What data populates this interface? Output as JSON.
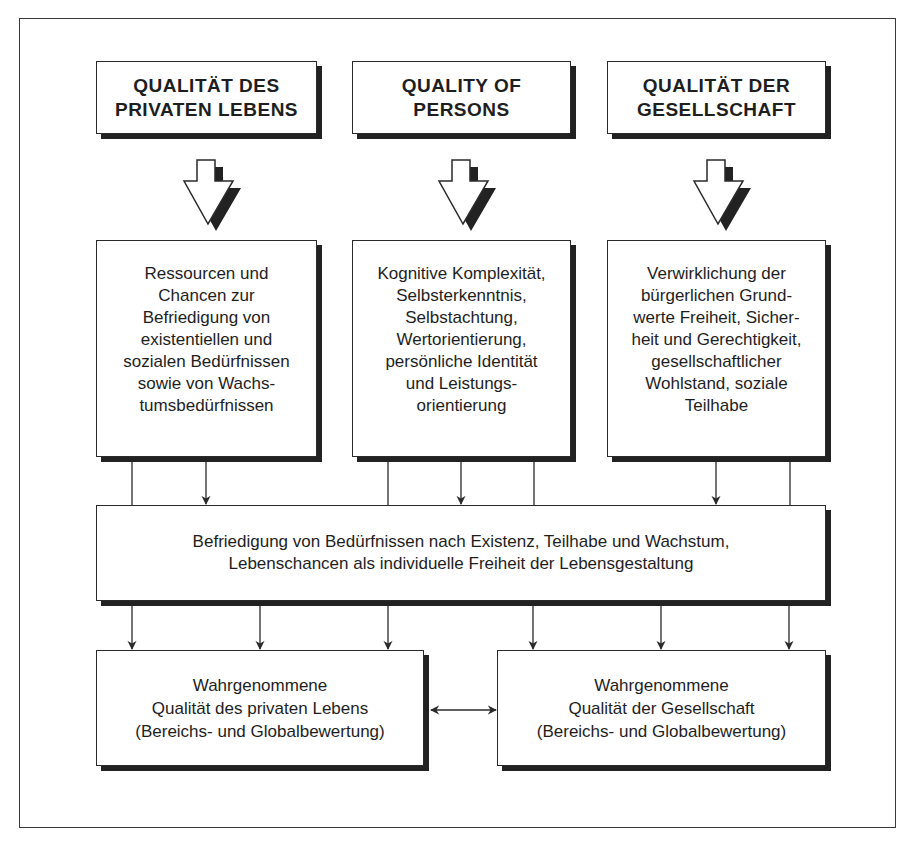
{
  "diagram": {
    "headers": [
      {
        "id": "private",
        "label": "QUALITÄT DES\nPRIVATEN LEBENS"
      },
      {
        "id": "persons",
        "label": "QUALITY OF\nPERSONS"
      },
      {
        "id": "society",
        "label": "QUALITÄT DER\nGESELLSCHAFT"
      }
    ],
    "details": [
      {
        "id": "private",
        "text": "Ressourcen und\nChancen zur\nBefriedigung von\nexistentiellen und\nsozialen Bedürfnissen\nsowie von Wachs-\ntumsbedürfnissen"
      },
      {
        "id": "persons",
        "text": "Kognitive Komplexität,\nSelbsterkenntnis,\nSelbstachtung,\nWertorientierung,\npersönliche Identität\nund Leistungs-\norientierung"
      },
      {
        "id": "society",
        "text": "Verwirklichung der\nbürgerlichen Grund-\nwerte Freiheit, Sicher-\nheit und Gerechtigkeit,\ngesellschaftlicher\nWohlstand, soziale\nTeilhabe"
      }
    ],
    "synthesis": {
      "text": "Befriedigung von Bedürfnissen nach Existenz, Teilhabe und Wachstum,\nLebenschancen als individuelle Freiheit der Lebensgestaltung"
    },
    "outcomes": [
      {
        "id": "perceived-private",
        "text": "Wahrgenommene\nQualität des privaten Lebens\n(Bereichs- und Globalbewertung)"
      },
      {
        "id": "perceived-society",
        "text": "Wahrgenommene\nQualität der Gesellschaft\n(Bereichs- und Globalbewertung)"
      }
    ],
    "connectors": {
      "block_arrows": 3,
      "detail_to_synthesis_arrows": 3,
      "synthesis_to_outcome_arrows": 6,
      "outcome_link": "bidirectional"
    },
    "colors": {
      "line": "#2a2a2a",
      "shadow": "#222222",
      "background": "#ffffff"
    }
  }
}
